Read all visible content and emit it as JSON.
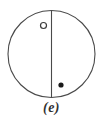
{
  "figure": {
    "caption": "(e)",
    "background_color": "#ffffff",
    "stroke_color": "#4a4a4a",
    "fill_color": "#1a1a1a",
    "caption_color": "#323232"
  },
  "diagram_data": {
    "type": "geometric-diagram",
    "description": "Circle divided by a vertical diameter with one hollow marker and one filled marker",
    "shapes": [
      {
        "name": "outer-circle",
        "kind": "circle",
        "cx": 51.5,
        "cy": 54,
        "r": 43.5,
        "fill": "none",
        "stroke": "#4a4a4a",
        "stroke_width": 1.1
      },
      {
        "name": "vertical-diameter",
        "kind": "line",
        "x1": 51.5,
        "y1": 10.5,
        "x2": 51.5,
        "y2": 97.5,
        "stroke": "#4a4a4a",
        "stroke_width": 1.1
      },
      {
        "name": "hollow-marker",
        "kind": "circle",
        "cx": 43.5,
        "cy": 25.5,
        "r": 3.0,
        "fill": "none",
        "stroke": "#3c3c3c",
        "stroke_width": 1.2,
        "quadrant": "upper-left"
      },
      {
        "name": "filled-marker",
        "kind": "circle",
        "cx": 61.0,
        "cy": 85.0,
        "r": 2.6,
        "fill": "#1a1a1a",
        "stroke": "none",
        "stroke_width": 0,
        "quadrant": "lower-right"
      }
    ]
  }
}
